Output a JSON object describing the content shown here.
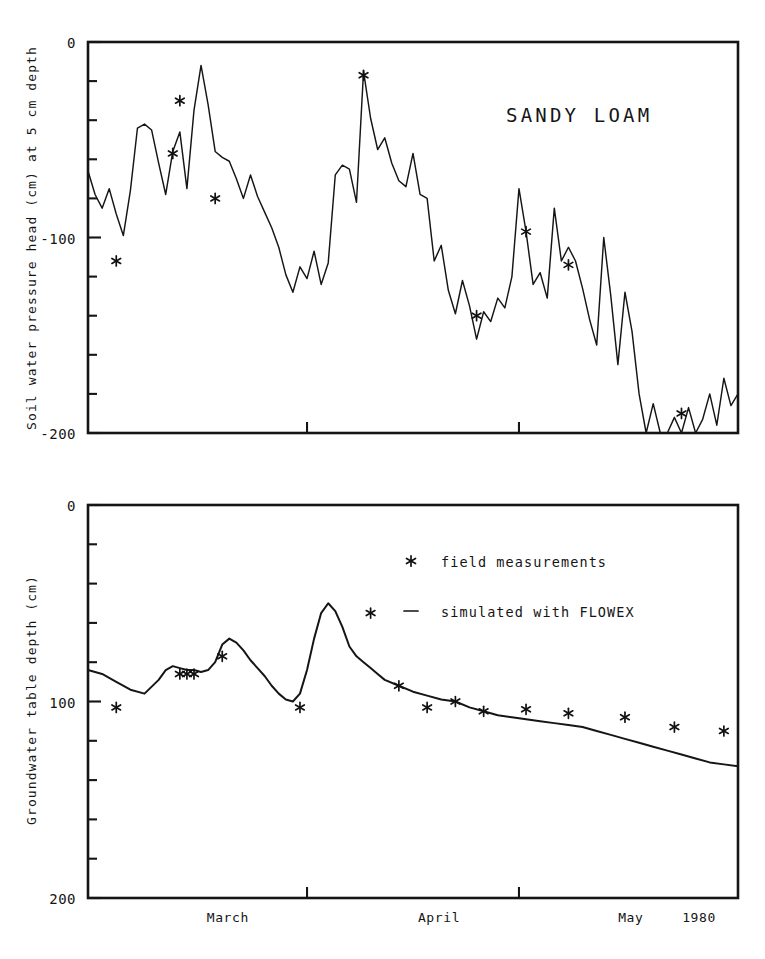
{
  "figure": {
    "width": 765,
    "height": 959,
    "background": "#ffffff",
    "ink_color": "#151515"
  },
  "chart_data": [
    {
      "id": "soil-water-pressure-head",
      "type": "line",
      "title": "SANDY LOAM",
      "xlabel": "",
      "ylabel": "Soil water pressure head (cm) at 5 cm depth",
      "ylim": [
        -200,
        0
      ],
      "yticks": [
        0,
        -100,
        -200
      ],
      "ytick_labels": [
        "0",
        "-100",
        "-200"
      ],
      "yminor_step": 20,
      "xlim": [
        0,
        92
      ],
      "xtick_positions": [
        31,
        61
      ],
      "grid": false,
      "legend": "none",
      "series": [
        {
          "name": "simulated with FLOWEX",
          "style": "line",
          "x": [
            0,
            1,
            2,
            3,
            4,
            5,
            6,
            7,
            8,
            9,
            10,
            11,
            12,
            13,
            14,
            15,
            16,
            17,
            18,
            19,
            20,
            21,
            22,
            23,
            24,
            25,
            26,
            27,
            28,
            29,
            30,
            31,
            32,
            33,
            34,
            35,
            36,
            37,
            38,
            39,
            40,
            41,
            42,
            43,
            44,
            45,
            46,
            47,
            48,
            49,
            50,
            51,
            52,
            53,
            54,
            55,
            56,
            57,
            58,
            59,
            60,
            61,
            62,
            63,
            64,
            65,
            66,
            67,
            68,
            69,
            70,
            71,
            72,
            73,
            74,
            75,
            76,
            77,
            78,
            79,
            80,
            81,
            82,
            83,
            84,
            85,
            86,
            87,
            88,
            89,
            90,
            91,
            92
          ],
          "values": [
            -66,
            -78,
            -85,
            -75,
            -88,
            -99,
            -76,
            -44,
            -42,
            -45,
            -62,
            -78,
            -56,
            -46,
            -75,
            -35,
            -12,
            -32,
            -56,
            -59,
            -61,
            -70,
            -80,
            -68,
            -79,
            -87,
            -95,
            -105,
            -119,
            -128,
            -115,
            -121,
            -107,
            -124,
            -113,
            -68,
            -63,
            -65,
            -82,
            -15,
            -39,
            -55,
            -49,
            -62,
            -71,
            -74,
            -57,
            -78,
            -80,
            -112,
            -104,
            -127,
            -139,
            -122,
            -135,
            -152,
            -138,
            -143,
            -131,
            -136,
            -120,
            -75,
            -97,
            -124,
            -118,
            -131,
            -85,
            -112,
            -105,
            -112,
            -126,
            -142,
            -155,
            -100,
            -130,
            -165,
            -128,
            -148,
            -180,
            -200,
            -185,
            -200,
            -200,
            -192,
            -200,
            -187,
            -200,
            -193,
            -180,
            -196,
            -172,
            -186,
            -180
          ]
        },
        {
          "name": "field measurements",
          "style": "marker",
          "x": [
            4,
            12,
            13,
            18,
            39,
            55,
            62,
            68,
            84
          ],
          "values": [
            -112,
            -57,
            -30,
            -80,
            -17,
            -140,
            -97,
            -114,
            -190
          ]
        }
      ]
    },
    {
      "id": "groundwater-table-depth",
      "type": "line",
      "title": "",
      "xlabel": "",
      "ylabel": "Groundwater table depth (cm)",
      "ylim": [
        200,
        0
      ],
      "yticks": [
        0,
        100,
        200
      ],
      "ytick_labels": [
        "0",
        "100",
        "200"
      ],
      "yminor_step": 20,
      "xlim": [
        0,
        92
      ],
      "xtick_positions": [
        31,
        61
      ],
      "grid": false,
      "legend": "inside-top-right",
      "legend_items": [
        {
          "marker": "*",
          "label": "field measurements"
        },
        {
          "marker": "-",
          "label": "simulated with FLOWEX"
        }
      ],
      "series": [
        {
          "name": "simulated with FLOWEX",
          "style": "line",
          "x": [
            0,
            2,
            4,
            6,
            8,
            10,
            11,
            12,
            13,
            14,
            15,
            16,
            17,
            18,
            19,
            20,
            21,
            22,
            23,
            24,
            25,
            26,
            27,
            28,
            29,
            30,
            31,
            32,
            33,
            34,
            35,
            36,
            37,
            38,
            39,
            40,
            41,
            42,
            44,
            46,
            48,
            50,
            52,
            54,
            56,
            58,
            60,
            62,
            64,
            66,
            68,
            70,
            72,
            74,
            76,
            78,
            80,
            82,
            84,
            86,
            88,
            90,
            92
          ],
          "values": [
            84,
            86,
            90,
            94,
            96,
            89,
            84,
            82,
            83,
            84,
            84,
            85,
            84,
            80,
            71,
            68,
            70,
            74,
            79,
            83,
            87,
            92,
            96,
            99,
            100,
            96,
            84,
            68,
            55,
            50,
            54,
            62,
            72,
            77,
            80,
            83,
            86,
            89,
            92,
            95,
            97,
            99,
            100,
            103,
            105,
            107,
            108,
            109,
            110,
            111,
            112,
            113,
            115,
            117,
            119,
            121,
            123,
            125,
            127,
            129,
            131,
            132,
            133
          ]
        },
        {
          "name": "field measurements",
          "style": "marker",
          "x": [
            4,
            13,
            14,
            15,
            19,
            30,
            40,
            44,
            48,
            52,
            56,
            62,
            68,
            76,
            83,
            90
          ],
          "values": [
            103,
            86,
            86,
            86,
            77,
            103,
            55,
            92,
            103,
            100,
            105,
            104,
            106,
            108,
            113,
            115
          ]
        }
      ]
    }
  ],
  "axis": {
    "x_labels": [
      {
        "text": "March",
        "position_pct": 21.5
      },
      {
        "text": "April",
        "position_pct": 54.0
      },
      {
        "text": "May",
        "position_pct": 83.5
      },
      {
        "text": "1980",
        "position_pct": 94.0
      }
    ]
  }
}
